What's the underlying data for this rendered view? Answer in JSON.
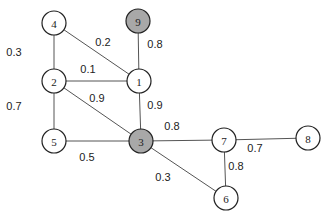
{
  "graph": {
    "nodes": [
      {
        "id": "4",
        "label": "4",
        "x": 54,
        "y": 23,
        "fill": "#ffffff"
      },
      {
        "id": "9",
        "label": "9",
        "x": 138,
        "y": 21,
        "fill": "#a8a8a8"
      },
      {
        "id": "2",
        "label": "2",
        "x": 54,
        "y": 81,
        "fill": "#ffffff"
      },
      {
        "id": "1",
        "label": "1",
        "x": 139,
        "y": 81,
        "fill": "#ffffff"
      },
      {
        "id": "5",
        "label": "5",
        "x": 54,
        "y": 141,
        "fill": "#ffffff"
      },
      {
        "id": "3",
        "label": "3",
        "x": 141,
        "y": 141,
        "fill": "#a8a8a8"
      },
      {
        "id": "7",
        "label": "7",
        "x": 224,
        "y": 140,
        "fill": "#ffffff"
      },
      {
        "id": "8",
        "label": "8",
        "x": 308,
        "y": 138,
        "fill": "#ffffff"
      },
      {
        "id": "6",
        "label": "6",
        "x": 226,
        "y": 198,
        "fill": "#ffffff"
      }
    ],
    "edges": [
      {
        "from": "4",
        "to": "2",
        "weight": "0.3",
        "lx": 14,
        "ly": 52
      },
      {
        "from": "4",
        "to": "1",
        "weight": "0.2",
        "lx": 103,
        "ly": 42
      },
      {
        "from": "9",
        "to": "1",
        "weight": "0.8",
        "lx": 155,
        "ly": 44
      },
      {
        "from": "2",
        "to": "1",
        "weight": "0.1",
        "lx": 88,
        "ly": 69
      },
      {
        "from": "2",
        "to": "3",
        "weight": "0.9",
        "lx": 97,
        "ly": 98
      },
      {
        "from": "1",
        "to": "3",
        "weight": "0.9",
        "lx": 155,
        "ly": 105
      },
      {
        "from": "2",
        "to": "5",
        "weight": "0.7",
        "lx": 14,
        "ly": 106
      },
      {
        "from": "5",
        "to": "3",
        "weight": "0.5",
        "lx": 87,
        "ly": 157
      },
      {
        "from": "3",
        "to": "7",
        "weight": "0.8",
        "lx": 172,
        "ly": 126
      },
      {
        "from": "3",
        "to": "6",
        "weight": "0.3",
        "lx": 163,
        "ly": 177
      },
      {
        "from": "7",
        "to": "8",
        "weight": "0.7",
        "lx": 255,
        "ly": 148
      },
      {
        "from": "7",
        "to": "6",
        "weight": "0.8",
        "lx": 236,
        "ly": 166
      }
    ],
    "radius": 12
  }
}
